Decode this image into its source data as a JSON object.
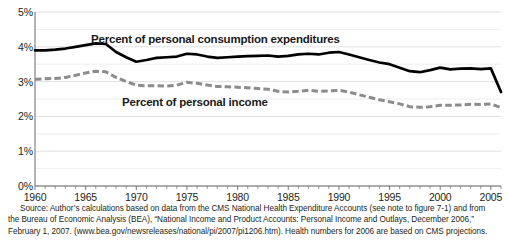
{
  "figure": {
    "title": "Figure 7-2. National health expenditures as a percentage of personal income and consumption",
    "background_color": "#ffffff"
  },
  "axes": {
    "y": {
      "label": "",
      "unit": "%",
      "min": 0,
      "max": 5,
      "major_step": 1,
      "minor_step": 0.5,
      "ticks": [
        "0%",
        "1%",
        "2%",
        "3%",
        "4%",
        "5%"
      ],
      "grid": true
    },
    "x": {
      "label": "",
      "min": 1960,
      "max": 2006,
      "major_step": 5,
      "minor_step": 1,
      "ticks": [
        "1960",
        "1965",
        "1970",
        "1975",
        "1980",
        "1985",
        "1990",
        "1995",
        "2000",
        "2005"
      ],
      "grid": false
    }
  },
  "annotations": {
    "pce_label": "Percent of personal consumption expenditures",
    "income_label": "Percent of personal income"
  },
  "colors": {
    "pce_line": "#000000",
    "income_line": "#8c8c8c",
    "gridline": "#d9d9d9",
    "axis": "#6b6b6b",
    "text": "#231f20"
  },
  "source": {
    "line1": "Source: Author’s calculations based on data from the CMS National Health Expenditure Accounts (see note to figure 7-1) and from",
    "line2": "the Bureau of Economic Analysis (BEA), “National Income and Product Accounts: Personal Income and Outlays, December 2006,”",
    "line3": "February 1, 2007. (www.bea.gov/newsreleases/national/pi/2007/pi1206.htm). Health numbers for 2006 are based on CMS projections."
  },
  "chart_data": {
    "type": "line",
    "title": "National health expenditures as a percentage of personal income and consumption",
    "xlabel": "",
    "ylabel": "",
    "xlim": [
      1960,
      2006
    ],
    "ylim": [
      0,
      5
    ],
    "grid": true,
    "legend_position": "inline-annotation",
    "x": [
      1960,
      1961,
      1962,
      1963,
      1964,
      1965,
      1966,
      1967,
      1968,
      1969,
      1970,
      1971,
      1972,
      1973,
      1974,
      1975,
      1976,
      1977,
      1978,
      1979,
      1980,
      1981,
      1982,
      1983,
      1984,
      1985,
      1986,
      1987,
      1988,
      1989,
      1990,
      1991,
      1992,
      1993,
      1994,
      1995,
      1996,
      1997,
      1998,
      1999,
      2000,
      2001,
      2002,
      2003,
      2004,
      2005,
      2006
    ],
    "series": [
      {
        "name": "Percent of personal consumption expenditures",
        "style": "solid",
        "color": "#000000",
        "values": [
          3.9,
          3.9,
          3.92,
          3.95,
          4.0,
          4.05,
          4.1,
          4.08,
          3.85,
          3.7,
          3.57,
          3.62,
          3.68,
          3.7,
          3.72,
          3.8,
          3.78,
          3.72,
          3.68,
          3.7,
          3.72,
          3.73,
          3.74,
          3.75,
          3.72,
          3.74,
          3.78,
          3.8,
          3.78,
          3.83,
          3.85,
          3.78,
          3.7,
          3.62,
          3.55,
          3.5,
          3.4,
          3.3,
          3.27,
          3.33,
          3.4,
          3.35,
          3.37,
          3.38,
          3.36,
          3.38,
          2.7
        ]
      },
      {
        "name": "Percent of personal income",
        "style": "dashed",
        "color": "#8c8c8c",
        "values": [
          3.07,
          3.08,
          3.09,
          3.12,
          3.18,
          3.25,
          3.3,
          3.28,
          3.12,
          3.0,
          2.9,
          2.88,
          2.88,
          2.87,
          2.9,
          2.98,
          2.95,
          2.9,
          2.86,
          2.85,
          2.84,
          2.82,
          2.8,
          2.78,
          2.72,
          2.7,
          2.72,
          2.75,
          2.72,
          2.73,
          2.75,
          2.7,
          2.62,
          2.55,
          2.48,
          2.42,
          2.36,
          2.28,
          2.26,
          2.28,
          2.32,
          2.32,
          2.33,
          2.35,
          2.34,
          2.36,
          2.25
        ]
      }
    ]
  }
}
